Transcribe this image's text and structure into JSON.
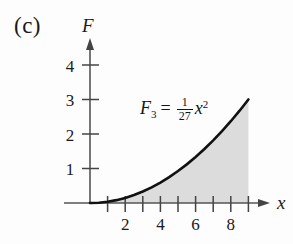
{
  "figure": {
    "panel_label": "(c)",
    "background_color": "#fdfdfd",
    "curve_color": "#111111",
    "axis_color": "#555555",
    "shade_color": "#dcdcdc"
  },
  "equation": {
    "lhs_symbol": "F",
    "lhs_subscript": "3",
    "equals": "=",
    "fraction_numerator": "1",
    "fraction_denominator": "27",
    "variable": "x",
    "exponent": "2",
    "plain_text": "F_3 = (1/27) x^2"
  },
  "chart_data": {
    "type": "line",
    "title": "",
    "subtitle": "",
    "xlabel": "x",
    "ylabel": "F",
    "xlim": [
      0,
      10.2
    ],
    "ylim": [
      0,
      4.6
    ],
    "grid": false,
    "legend": null,
    "annotations": [
      {
        "text": "F_3 = (1/27) x^2",
        "x": 3.2,
        "y": 2.6
      }
    ],
    "x_ticks": [
      1,
      2,
      3,
      4,
      5,
      6,
      7,
      8,
      9
    ],
    "x_tick_labels": [
      "",
      "2",
      "",
      "4",
      "",
      "6",
      "",
      "8",
      ""
    ],
    "y_ticks": [
      1,
      2,
      3,
      4
    ],
    "y_tick_labels": [
      "1",
      "2",
      "3",
      "4"
    ],
    "fill_to_zero": true,
    "series": [
      {
        "name": "F_3 = (1/27) x^2",
        "formula": "y = x^2 / 27",
        "x": [
          0,
          0.5,
          1,
          1.5,
          2,
          2.5,
          3,
          3.5,
          4,
          4.5,
          5,
          5.5,
          6,
          6.5,
          7,
          7.5,
          8,
          8.5,
          9
        ],
        "values": [
          0,
          0.009,
          0.037,
          0.083,
          0.148,
          0.231,
          0.333,
          0.454,
          0.593,
          0.75,
          0.926,
          1.12,
          1.333,
          1.565,
          1.815,
          2.083,
          2.37,
          2.676,
          3.0
        ]
      }
    ]
  }
}
